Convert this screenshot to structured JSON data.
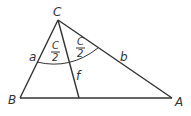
{
  "diagram": {
    "vertices": {
      "C": {
        "label": "C",
        "x": 58,
        "y": 20
      },
      "B": {
        "label": "B",
        "x": 20,
        "y": 98
      },
      "A": {
        "label": "A",
        "x": 172,
        "y": 98
      }
    },
    "bisector_foot": {
      "x": 79,
      "y": 98
    },
    "side_labels": {
      "a": "a",
      "b": "b",
      "f": "f"
    },
    "half_angle": {
      "numerator": "C",
      "denominator": "2"
    },
    "stroke_color": "#333333"
  }
}
